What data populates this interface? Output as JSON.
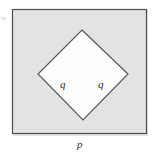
{
  "figure": {
    "kind": "geometry-diagram",
    "outer_shape": {
      "name": "outer-square",
      "side_label": "p",
      "fill_color": "#e2e2e2",
      "stroke_color": "#4a4a4a",
      "x": 12,
      "y": 9,
      "width": 135,
      "height": 125
    },
    "inner_shape": {
      "name": "inner-diamond",
      "side_label": "q",
      "fill_color": "#ffffff",
      "stroke_color": "#555555",
      "vertices": [
        {
          "name": "top",
          "x": 82,
          "y": 30
        },
        {
          "name": "right",
          "x": 128,
          "y": 74
        },
        {
          "name": "bottom",
          "x": 83,
          "y": 120
        },
        {
          "name": "left",
          "x": 38,
          "y": 74
        }
      ]
    },
    "labels": [
      {
        "name": "q-left",
        "text": "q",
        "x": 60,
        "y": 79
      },
      {
        "name": "q-right",
        "text": "q",
        "x": 98,
        "y": 79
      },
      {
        "name": "p-bottom",
        "text": "p",
        "x": 77,
        "y": 139
      }
    ],
    "background_color": "#ffffff"
  }
}
